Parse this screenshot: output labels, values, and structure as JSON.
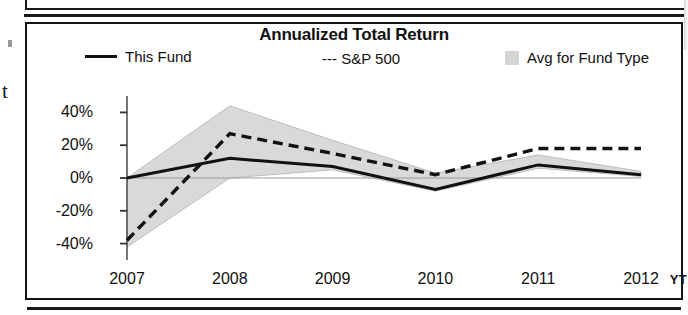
{
  "panel": {
    "title": "Annualized Total Return"
  },
  "legend": {
    "items": [
      {
        "label": "This Fund",
        "marker": "solid-line-swatch"
      },
      {
        "label": "--- S&P 500",
        "marker": "dashed-line-swatch"
      },
      {
        "label": "Avg for Fund Type",
        "marker": "gray-square-swatch"
      }
    ]
  },
  "axis": {
    "y_ticks": [
      "40%",
      "20%",
      "0%",
      "-20%",
      "-40%"
    ],
    "x_ticks": [
      "2007",
      "2008",
      "2009",
      "2010",
      "2011",
      "2012"
    ],
    "x_unit": "YT"
  },
  "scan_artifacts": {
    "left_glyph": "t"
  },
  "colors": {
    "line": "#111111",
    "band": "#d9d9d9",
    "band_edge": "#bdbdbd",
    "frame": "#121212",
    "background": "#ffffff"
  },
  "chart_data": {
    "type": "line",
    "title": "Annualized Total Return",
    "xlabel": "YT",
    "ylabel": "",
    "x": [
      "2007",
      "2008",
      "2009",
      "2010",
      "2011",
      "2012"
    ],
    "ylim": [
      -50,
      50
    ],
    "yticks": [
      40,
      20,
      0,
      -20,
      -40
    ],
    "ytick_labels": [
      "40%",
      "20%",
      "0%",
      "-20%",
      "-40%"
    ],
    "grid": false,
    "legend_position": "top",
    "series": [
      {
        "name": "This Fund",
        "style": "solid",
        "values": [
          0,
          12,
          7,
          -7,
          8,
          2
        ]
      },
      {
        "name": "S&P 500",
        "style": "dashed",
        "values": [
          -38,
          27,
          15,
          2,
          18,
          18
        ]
      },
      {
        "name": "Avg for Fund Type",
        "style": "shaded-band",
        "upper": [
          0,
          44,
          23,
          3,
          14,
          4
        ],
        "lower": [
          -42,
          0,
          5,
          -8,
          6,
          1
        ]
      }
    ]
  }
}
